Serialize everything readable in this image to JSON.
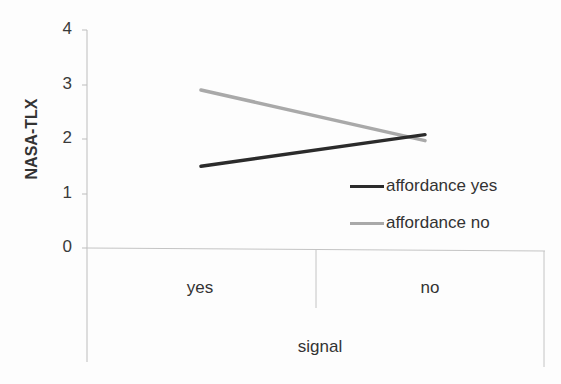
{
  "chart_data": {
    "type": "line",
    "title": "",
    "xlabel": "signal",
    "ylabel": "NASA-TLX",
    "categories": [
      "yes",
      "no"
    ],
    "series": [
      {
        "name": "affordance yes",
        "values": [
          1.5,
          2.08
        ],
        "color": "#2b2b2b"
      },
      {
        "name": "affordance no",
        "values": [
          2.9,
          1.97
        ],
        "color": "#a9a9a9"
      }
    ],
    "ylim": [
      0,
      4
    ],
    "yticks": [
      "0",
      "1",
      "2",
      "3",
      "4"
    ],
    "grid": false,
    "legend_position": "right-inside"
  },
  "axis": {
    "ylabel": "NASA-TLX",
    "xlabel": "signal",
    "yticks": [
      "4",
      "3",
      "2",
      "1",
      "0"
    ],
    "xcats": [
      "yes",
      "no"
    ]
  },
  "legend": [
    {
      "label": "affordance yes",
      "color": "#2b2b2b"
    },
    {
      "label": "affordance no",
      "color": "#a9a9a9"
    }
  ]
}
